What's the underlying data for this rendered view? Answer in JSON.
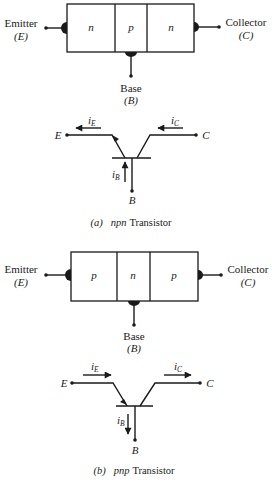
{
  "npn": {
    "block": {
      "regions": [
        "n",
        "p",
        "n"
      ],
      "emitter_label": "Emitter",
      "emitter_symbol": "(E)",
      "collector_label": "Collector",
      "collector_symbol": "(C)",
      "base_label": "Base",
      "base_symbol": "(B)"
    },
    "symbol": {
      "E": "E",
      "C": "C",
      "B": "B",
      "iE": "i",
      "iE_sub": "E",
      "iC": "i",
      "iC_sub": "C",
      "iB": "i",
      "iB_sub": "B",
      "iE_direction": "left",
      "iC_direction": "left",
      "iB_direction": "up"
    },
    "caption_prefix": "(a)",
    "caption_type": "npn",
    "caption_text": "Transistor"
  },
  "pnp": {
    "block": {
      "regions": [
        "p",
        "n",
        "p"
      ],
      "emitter_label": "Emitter",
      "emitter_symbol": "(E)",
      "collector_label": "Collector",
      "collector_symbol": "(C)",
      "base_label": "Base",
      "base_symbol": "(B)"
    },
    "symbol": {
      "E": "E",
      "C": "C",
      "B": "B",
      "iE": "i",
      "iE_sub": "E",
      "iC": "i",
      "iC_sub": "C",
      "iB": "i",
      "iB_sub": "B",
      "iE_direction": "right",
      "iC_direction": "right",
      "iB_direction": "down"
    },
    "caption_prefix": "(b)",
    "caption_type": "pnp",
    "caption_text": "Transistor"
  },
  "colors": {
    "ink": "#1a1a1a",
    "background": "#ffffff"
  }
}
